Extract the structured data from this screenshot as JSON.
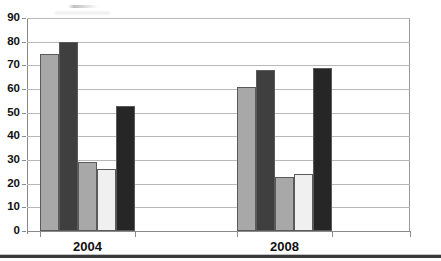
{
  "chart_data": {
    "type": "bar",
    "title": "",
    "subtitle": "",
    "xlabel": "",
    "ylabel": "",
    "categories": [
      "2004",
      "2008"
    ],
    "ylim": [
      0,
      90
    ],
    "yticks": [
      0,
      10,
      20,
      30,
      40,
      50,
      60,
      70,
      80,
      90
    ],
    "ytick_labels": [
      "0",
      "10",
      "20",
      "30",
      "40",
      "50",
      "60",
      "70",
      "80",
      "90"
    ],
    "grid": true,
    "grid_axis": "y",
    "legend": false,
    "legend_position": "none",
    "series": [
      {
        "name": "series-1",
        "color": "#A8A8A8",
        "values": [
          75,
          61
        ]
      },
      {
        "name": "series-2",
        "color": "#3F3F3F",
        "values": [
          80,
          68
        ]
      },
      {
        "name": "series-3",
        "color": "#A8A8A8",
        "values": [
          29,
          23
        ]
      },
      {
        "name": "series-4",
        "color": "#F0F0F0",
        "values": [
          26,
          24
        ]
      },
      {
        "name": "series-5",
        "color": "#262626",
        "values": [
          53,
          69
        ]
      }
    ]
  },
  "axes": {
    "y_ticks": [
      {
        "label": "90",
        "value": 90
      },
      {
        "label": "80",
        "value": 80
      },
      {
        "label": "70",
        "value": 70
      },
      {
        "label": "60",
        "value": 60
      },
      {
        "label": "50",
        "value": 50
      },
      {
        "label": "40",
        "value": 40
      },
      {
        "label": "30",
        "value": 30
      },
      {
        "label": "20",
        "value": 20
      },
      {
        "label": "10",
        "value": 10
      },
      {
        "label": "0",
        "value": 0
      }
    ],
    "x_ticks": [
      {
        "label": "2004"
      },
      {
        "label": "2008"
      }
    ]
  }
}
